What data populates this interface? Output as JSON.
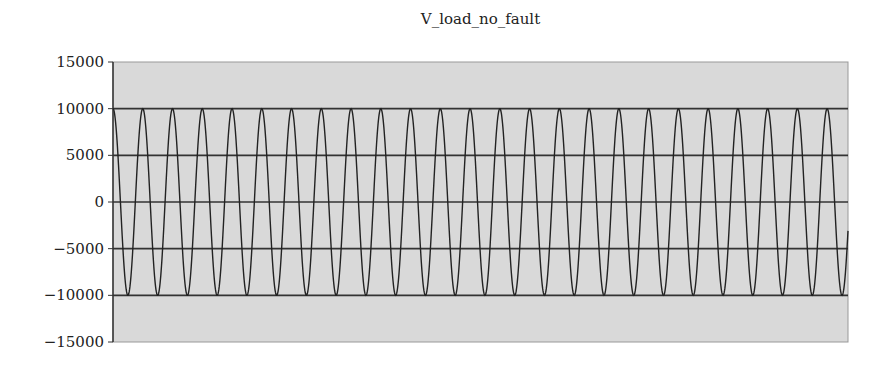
{
  "chart_data": {
    "type": "line",
    "title": "V_load_no_fault",
    "xlabel": "",
    "ylabel": "",
    "ylim": [
      -15000,
      15000
    ],
    "yticks": [
      15000,
      10000,
      5000,
      0,
      -5000,
      -10000,
      -15000
    ],
    "ytick_labels": [
      "15000",
      "10000",
      "5000",
      "0",
      "−5000",
      "−10000",
      "−15000"
    ],
    "grid": true,
    "gridlines_at": [
      10000,
      5000,
      0,
      -5000,
      -10000
    ],
    "legend": null,
    "series": [
      {
        "name": "V_load_no_fault",
        "waveform": "sinusoid",
        "amplitude": 10000,
        "cycles_visible": 24.7,
        "start_phase": "peak",
        "color": "#222222"
      }
    ],
    "plot_background": "#d9d9d9"
  }
}
